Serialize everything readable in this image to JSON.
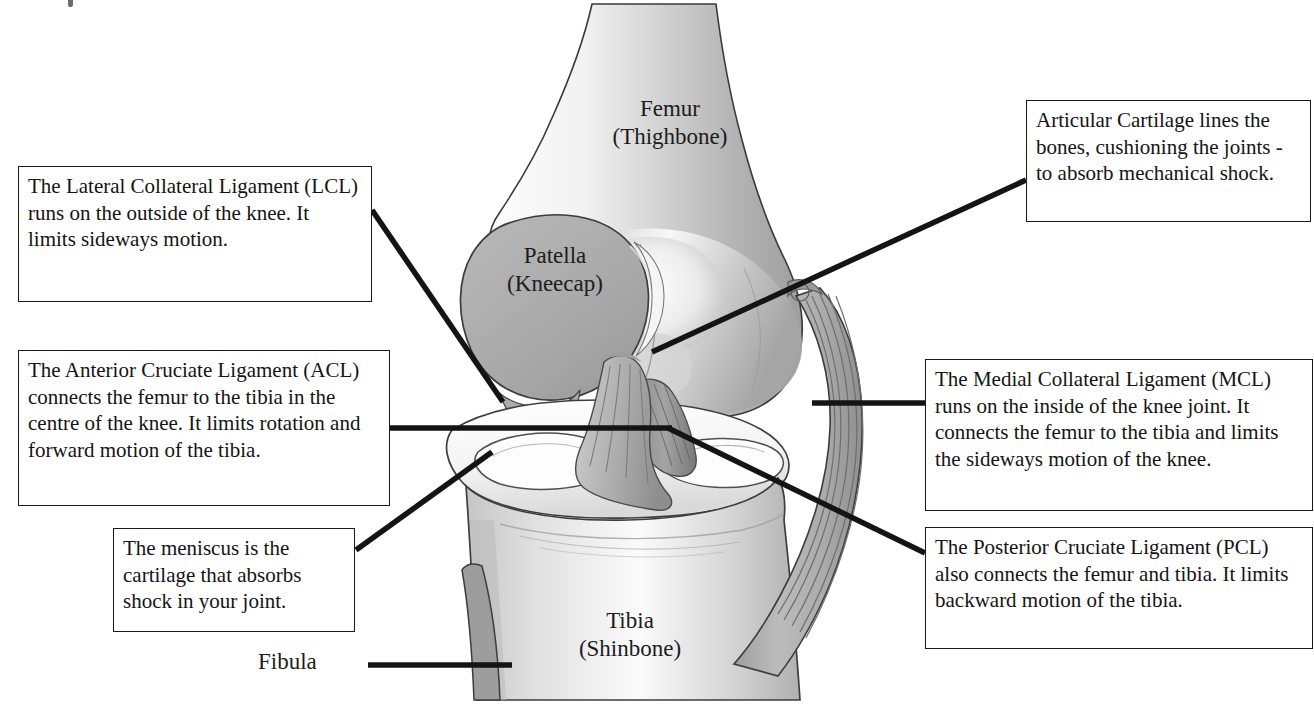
{
  "bone_labels": [
    {
      "id": "femur",
      "line1": "Femur",
      "line2": "(Thighbone)"
    },
    {
      "id": "patella",
      "line1": "Patella",
      "line2": "(Kneecap)"
    },
    {
      "id": "tibia",
      "line1": "Tibia",
      "line2": "(Shinbone)"
    },
    {
      "id": "fibula",
      "line1": "Fibula",
      "line2": ""
    }
  ],
  "callouts": {
    "lcl": {
      "text": "The Lateral Collateral Ligament (LCL) runs on the outside of the knee. It limits sideways motion."
    },
    "acl": {
      "text": "The Anterior Cruciate Ligament (ACL) connects the femur to the tibia in the centre of the knee. It limits rotation and forward motion of the tibia."
    },
    "meniscus": {
      "text": "The meniscus is the cartilage that absorbs shock in your joint."
    },
    "cartilage": {
      "text": "Articular Cartilage lines the bones, cushioning the joints - to absorb mechanical shock."
    },
    "mcl": {
      "text": "The Medial Collateral Ligament (MCL) runs on the inside of the knee joint. It connects the femur to the tibia and limits the sideways motion of the knee."
    },
    "pcl": {
      "text": "The Posterior Cruciate Ligament (PCL) also connects the femur and tibia. It limits backward motion of the tibia."
    }
  },
  "colors": {
    "background": "#ffffff",
    "line": "#141414",
    "bone_light": "#e6e6e6",
    "bone_mid": "#c9c9c9",
    "bone_shadow": "#a8a8a8",
    "patella_fill": "#a9a9a9",
    "ligament_fill": "#b3b3b3",
    "cartilage_white": "#fcfcfc"
  }
}
